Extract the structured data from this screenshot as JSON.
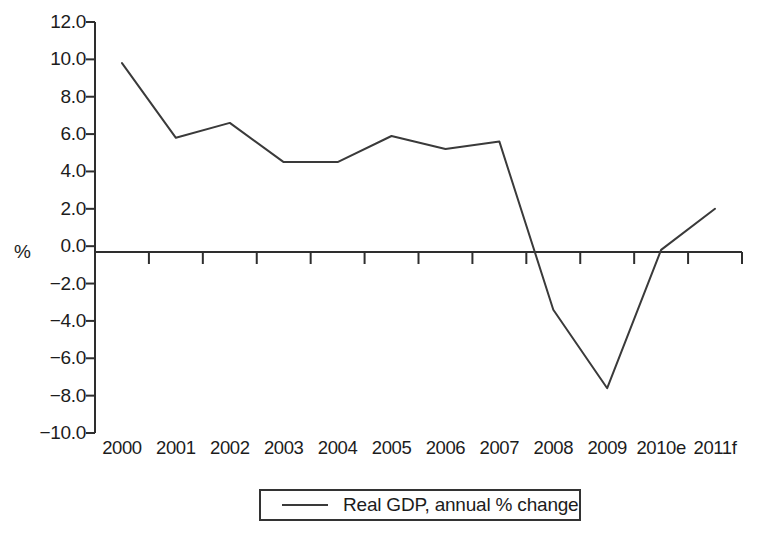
{
  "chart_data": {
    "type": "line",
    "title": "",
    "subtitle": "",
    "xlabel": "",
    "ylabel": "%",
    "categories": [
      "2000",
      "2001",
      "2002",
      "2003",
      "2004",
      "2005",
      "2006",
      "2007",
      "2008",
      "2009",
      "2010e",
      "2011f"
    ],
    "series": [
      {
        "name": "Real GDP, annual % change",
        "values": [
          9.8,
          5.8,
          6.6,
          4.5,
          4.5,
          5.9,
          5.2,
          5.6,
          -3.4,
          -7.6,
          -0.2,
          2.0
        ],
        "color": "#3a3a3a"
      }
    ],
    "ylim": [
      -10.0,
      12.0
    ],
    "ytick_labels": [
      "12.0",
      "10.0",
      "8.0",
      "6.0",
      "4.0",
      "2.0",
      "0.0",
      "−2.0",
      "−4.0",
      "−6.0",
      "−8.0",
      "−10.0"
    ],
    "ytick_values": [
      12.0,
      10.0,
      8.0,
      6.0,
      4.0,
      2.0,
      0.0,
      -2.0,
      -4.0,
      -6.0,
      -8.0,
      -10.0
    ],
    "grid": false,
    "zero_line": true,
    "legend_position": "bottom-center",
    "legend_entries": [
      "Real GDP, annual % change"
    ]
  },
  "legend": {
    "label": "Real GDP, annual % change"
  },
  "axis": {
    "y_title": "%"
  }
}
